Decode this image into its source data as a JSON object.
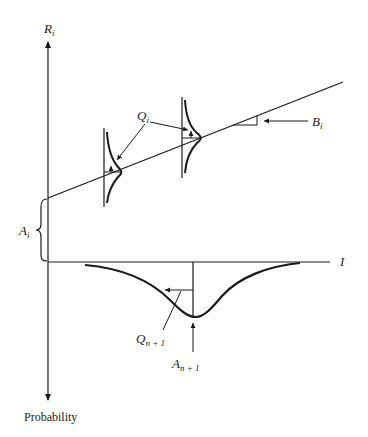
{
  "diagram": {
    "axes": {
      "vertical_up_label": "R",
      "vertical_up_sub": "i",
      "vertical_down_label": "Probability",
      "horizontal_label": "I"
    },
    "labels": {
      "Q_i": {
        "main": "Q",
        "sub": "i"
      },
      "B_i": {
        "main": "B",
        "sub": "i"
      },
      "A_i": {
        "main": "A",
        "sub": "i"
      },
      "Q_n1": {
        "main": "Q",
        "sub": "n + 1"
      },
      "A_n1": {
        "main": "A",
        "sub": "n + 1"
      }
    },
    "elements": [
      "regression line with intercept A_i and slope B_i",
      "two normal distributions along regression line with spread Q_i",
      "downward probability distribution for I with mean A_n+1 and spread Q_n+1"
    ],
    "colors": {
      "ink": "#1a1a1a",
      "background": "#ffffff"
    }
  }
}
